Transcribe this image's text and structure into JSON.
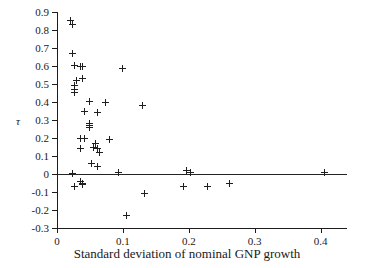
{
  "chart_data": {
    "type": "scatter",
    "title": "",
    "xlabel": "Standard deviation of nominal GNP growth",
    "ylabel": "τ",
    "xlim": [
      0,
      0.44
    ],
    "ylim": [
      -0.3,
      0.9
    ],
    "xticks": [
      0,
      0.1,
      0.2,
      0.3,
      0.4
    ],
    "xtick_labels": [
      "0",
      "0.1",
      "0.2",
      "0.3",
      "0.4"
    ],
    "yticks": [
      -0.3,
      -0.2,
      -0.1,
      0,
      0.1,
      0.2,
      0.3,
      0.4,
      0.5,
      0.6,
      0.7,
      0.8,
      0.9
    ],
    "ytick_labels": [
      "-0.3",
      "-0.2",
      "-0.1",
      "0",
      "0.1",
      "0.2",
      "0.3",
      "0.4",
      "0.5",
      "0.6",
      "0.7",
      "0.8",
      "0.9"
    ],
    "grid": false,
    "legend": null,
    "marker": "plus",
    "marker_color": "#1f1f1f",
    "reference_lines": [
      {
        "axis": "horizontal",
        "value": 0,
        "color": "#242424"
      }
    ],
    "points": [
      {
        "x": 0.021,
        "y": 0.855
      },
      {
        "x": 0.023,
        "y": 0.828
      },
      {
        "x": 0.024,
        "y": 0.672
      },
      {
        "x": 0.027,
        "y": 0.605
      },
      {
        "x": 0.035,
        "y": 0.6
      },
      {
        "x": 0.039,
        "y": 0.6
      },
      {
        "x": 0.1,
        "y": 0.588
      },
      {
        "x": 0.03,
        "y": 0.522
      },
      {
        "x": 0.038,
        "y": 0.533
      },
      {
        "x": 0.027,
        "y": 0.494
      },
      {
        "x": 0.027,
        "y": 0.472
      },
      {
        "x": 0.027,
        "y": 0.455
      },
      {
        "x": 0.073,
        "y": 0.4
      },
      {
        "x": 0.05,
        "y": 0.405
      },
      {
        "x": 0.13,
        "y": 0.378
      },
      {
        "x": 0.041,
        "y": 0.35
      },
      {
        "x": 0.062,
        "y": 0.344
      },
      {
        "x": 0.05,
        "y": 0.283
      },
      {
        "x": 0.05,
        "y": 0.272
      },
      {
        "x": 0.05,
        "y": 0.261
      },
      {
        "x": 0.036,
        "y": 0.2
      },
      {
        "x": 0.041,
        "y": 0.2
      },
      {
        "x": 0.08,
        "y": 0.194
      },
      {
        "x": 0.058,
        "y": 0.172
      },
      {
        "x": 0.035,
        "y": 0.144
      },
      {
        "x": 0.056,
        "y": 0.15
      },
      {
        "x": 0.061,
        "y": 0.144
      },
      {
        "x": 0.065,
        "y": 0.117
      },
      {
        "x": 0.053,
        "y": 0.061
      },
      {
        "x": 0.061,
        "y": 0.044
      },
      {
        "x": 0.023,
        "y": 0.005
      },
      {
        "x": 0.093,
        "y": 0.011
      },
      {
        "x": 0.196,
        "y": 0.017
      },
      {
        "x": 0.203,
        "y": 0.011
      },
      {
        "x": 0.406,
        "y": 0.011
      },
      {
        "x": 0.036,
        "y": -0.039
      },
      {
        "x": 0.038,
        "y": -0.05
      },
      {
        "x": 0.038,
        "y": -0.056
      },
      {
        "x": 0.026,
        "y": -0.072
      },
      {
        "x": 0.192,
        "y": -0.067
      },
      {
        "x": 0.228,
        "y": -0.072
      },
      {
        "x": 0.262,
        "y": -0.05
      },
      {
        "x": 0.133,
        "y": -0.111
      },
      {
        "x": 0.105,
        "y": -0.233
      }
    ]
  }
}
